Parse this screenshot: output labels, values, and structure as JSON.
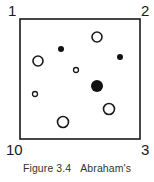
{
  "figure": {
    "corners": {
      "top_left": "1",
      "top_right": "2",
      "bottom_right": "3",
      "bottom_left": "10"
    },
    "caption": {
      "label": "Figure 3.4",
      "title": "Abraham's"
    },
    "colors": {
      "stroke": "#1a1a1a",
      "fill_filled": "#111111",
      "fill_open": "#ffffff"
    },
    "circles": [
      {
        "x": 97,
        "y": 37,
        "r": 5,
        "type": "open"
      },
      {
        "x": 61,
        "y": 49,
        "r": 3,
        "type": "filled"
      },
      {
        "x": 120,
        "y": 57,
        "r": 3,
        "type": "filled"
      },
      {
        "x": 38,
        "y": 61,
        "r": 5,
        "type": "open"
      },
      {
        "x": 76,
        "y": 70,
        "r": 2.5,
        "type": "open"
      },
      {
        "x": 97,
        "y": 86,
        "r": 6,
        "type": "filled"
      },
      {
        "x": 35,
        "y": 94,
        "r": 2.5,
        "type": "open"
      },
      {
        "x": 109,
        "y": 109,
        "r": 5.5,
        "type": "open"
      },
      {
        "x": 63,
        "y": 122,
        "r": 5.5,
        "type": "open"
      }
    ]
  }
}
